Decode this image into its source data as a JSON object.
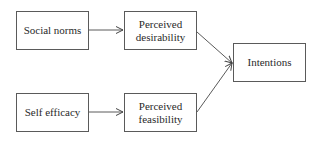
{
  "diagram": {
    "type": "flowchart",
    "nodes": [
      {
        "id": "social_norms",
        "label": "Social norms"
      },
      {
        "id": "perceived_desirability",
        "label_line1": "Perceived",
        "label_line2": "desirability"
      },
      {
        "id": "intentions",
        "label": "Intentions"
      },
      {
        "id": "self_efficacy",
        "label": "Self efficacy"
      },
      {
        "id": "perceived_feasibility",
        "label_line1": "Perceived",
        "label_line2": "feasibility"
      }
    ],
    "edges": [
      {
        "from": "social_norms",
        "to": "perceived_desirability"
      },
      {
        "from": "self_efficacy",
        "to": "perceived_feasibility"
      },
      {
        "from": "perceived_desirability",
        "to": "intentions"
      },
      {
        "from": "perceived_feasibility",
        "to": "intentions"
      }
    ],
    "colors": {
      "stroke": "#5a5a5a",
      "text": "#2a2a2a",
      "background": "#ffffff"
    }
  }
}
